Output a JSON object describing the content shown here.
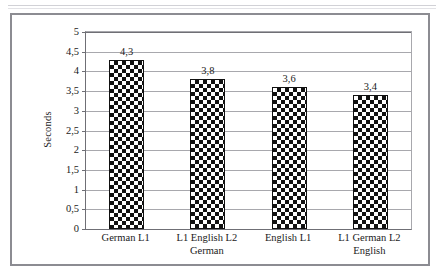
{
  "figure": {
    "decorative_top_rule": true
  },
  "chart_data": {
    "type": "bar",
    "title": "",
    "subtitle": "",
    "xlabel": "",
    "ylabel": "Seconds",
    "ylim": [
      0,
      5
    ],
    "ytick_step": 0.5,
    "decimal_separator": ",",
    "grid": "horizontal",
    "legend": "none",
    "bar_fill": "black-white-checkerboard",
    "categories": [
      "German L1",
      "L1 English L2 German",
      "English L1",
      "L1 German L2 English"
    ],
    "category_lines": [
      [
        "German L1",
        ""
      ],
      [
        "L1 English L2",
        "German"
      ],
      [
        "English L1",
        ""
      ],
      [
        "L1 German L2",
        "English"
      ]
    ],
    "values": [
      4.3,
      3.8,
      3.6,
      3.4
    ],
    "value_labels": [
      "4,3",
      "3,8",
      "3,6",
      "3,4"
    ],
    "ytick_labels": [
      "0",
      "0,5",
      "1",
      "1,5",
      "2",
      "2,5",
      "3",
      "3,5",
      "4",
      "4,5",
      "5"
    ],
    "ytick_values": [
      0,
      0.5,
      1,
      1.5,
      2,
      2.5,
      3,
      3.5,
      4,
      4.5,
      5
    ],
    "colors": {
      "bar_fill_dark": "#111111",
      "bar_fill_light": "#ffffff",
      "bar_outline": "#111111",
      "gridline": "#a8a8ad",
      "axis": "#6f6f75",
      "frame": "#8c8c92",
      "text": "#1a1a1a",
      "background": "#ffffff"
    }
  }
}
